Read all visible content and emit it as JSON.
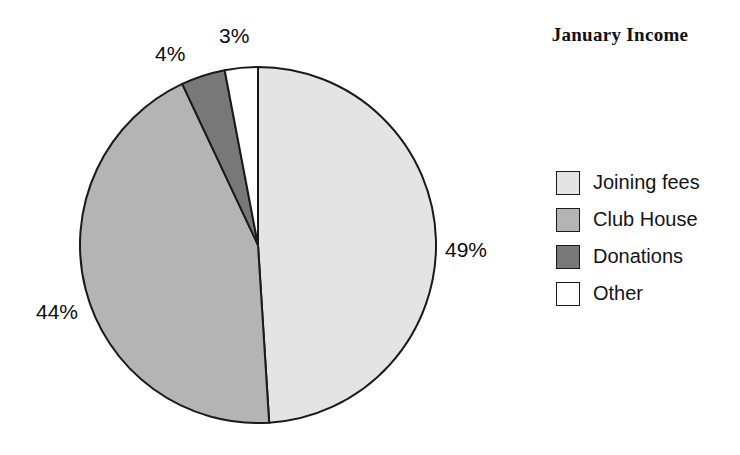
{
  "chart_data": {
    "type": "pie",
    "title": "January Income",
    "categories": [
      "Joining fees",
      "Club House",
      "Donations",
      "Other"
    ],
    "values": [
      49,
      44,
      4,
      3
    ],
    "value_labels": [
      "49%",
      "44%",
      "4%",
      "3%"
    ],
    "units": "percent",
    "start_angle_deg": 0,
    "direction": "clockwise",
    "colors": [
      "#e4e4e4",
      "#b4b4b4",
      "#787878",
      "#ffffff"
    ],
    "slice_outline_color": "#1a1a1a",
    "legend_position": "right",
    "xlabel": "",
    "ylabel": "",
    "grid": false
  },
  "title": {
    "text": "January Income"
  },
  "labels": {
    "joining_fees": "49%",
    "club_house": "44%",
    "donations": "4%",
    "other": "3%"
  },
  "legend": {
    "items": [
      {
        "label": "Joining fees",
        "color": "#e4e4e4"
      },
      {
        "label": "Club House",
        "color": "#b4b4b4"
      },
      {
        "label": "Donations",
        "color": "#787878"
      },
      {
        "label": "Other",
        "color": "#ffffff"
      }
    ]
  }
}
